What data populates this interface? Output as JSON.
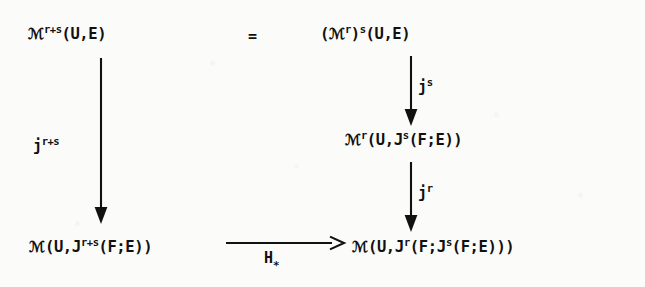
{
  "diagram": {
    "ink_color": "#111110",
    "paper_color": "#fbfbfa",
    "nodes": [
      {
        "id": "top-left",
        "base": "ℳ",
        "superscript": "r+s",
        "argument": "(U,E)",
        "text": "ℳ^{r+s}(U,E)"
      },
      {
        "id": "top-right",
        "text": "(ℳ^{r})^{s}(U,E)",
        "open_paren": "(",
        "base": "ℳ",
        "superscript_inner": "r",
        "close_paren": ")",
        "superscript_outer": "s",
        "argument": "(U,E)"
      },
      {
        "id": "middle-right",
        "text": "ℳ^{r}(U,J^{s}(F;E))",
        "base": "ℳ",
        "superscript": "r",
        "arg_open": "(U,",
        "jet": "J",
        "jet_superscript": "s",
        "jet_arg": "(F;E)",
        "arg_close": ")"
      },
      {
        "id": "bottom-left",
        "text": "ℳ(U,J^{r+s}(F;E))",
        "base": "ℳ",
        "arg_open": "(U,",
        "jet": "J",
        "jet_superscript": "r+s",
        "jet_arg": "(F;E)",
        "arg_close": ")"
      },
      {
        "id": "bottom-right",
        "text": "ℳ(U,J^{r}(F;J^{s}(F;E)))",
        "base": "ℳ",
        "arg_open": "(U,",
        "jet": "J",
        "jet_superscript": "r",
        "inner_open": "(F;",
        "jet2": "J",
        "jet2_superscript": "s",
        "jet2_arg": "(F;E)",
        "closers": "))"
      }
    ],
    "relations": {
      "equals": "="
    },
    "arrows": [
      {
        "id": "left-vertical",
        "direction": "down",
        "label_base": "j",
        "label_superscript": "r+s",
        "label": "j^{r+s}",
        "from": "top-left",
        "to": "bottom-left"
      },
      {
        "id": "right-vertical-upper",
        "direction": "down",
        "label_base": "j",
        "label_superscript": "s",
        "label": "j^{s}",
        "from": "top-right",
        "to": "middle-right"
      },
      {
        "id": "right-vertical-lower",
        "direction": "down",
        "label_base": "j",
        "label_superscript": "r",
        "label": "j^{r}",
        "from": "middle-right",
        "to": "bottom-right"
      },
      {
        "id": "bottom-horizontal",
        "direction": "right",
        "label_base": "H",
        "label_subscript": "∗",
        "label": "H_{*}",
        "from": "bottom-left",
        "to": "bottom-right"
      }
    ]
  }
}
